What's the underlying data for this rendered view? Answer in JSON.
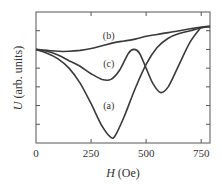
{
  "chart_data": {
    "type": "line",
    "title": "",
    "xlabel": "H (Oe)",
    "xlabel_italic": "H",
    "xlabel_unit": "(Oe)",
    "ylabel": "U (arb. units)",
    "ylabel_italic": "U",
    "ylabel_unit": "(arb. units)",
    "xlim": [
      0,
      790
    ],
    "ylim": [
      0,
      7
    ],
    "xticks": [
      0,
      250,
      500,
      750
    ],
    "xtick_labels": [
      "0",
      "250",
      "500",
      "750"
    ],
    "yticks": [
      1,
      2,
      3,
      4,
      5,
      6
    ],
    "ytick_labels": [],
    "grid": false,
    "legend": "inline curve labels",
    "series": [
      {
        "name": "(a)",
        "label_pos": [
          330,
          2.0
        ],
        "x": [
          0,
          50,
          100,
          150,
          200,
          250,
          300,
          340,
          360,
          400,
          450,
          500,
          550,
          600,
          650,
          700,
          750,
          790
        ],
        "y": [
          5.0,
          4.8,
          4.5,
          4.0,
          3.2,
          2.1,
          0.9,
          0.3,
          0.4,
          1.4,
          2.9,
          4.2,
          5.1,
          5.6,
          5.85,
          6.0,
          6.15,
          6.2
        ]
      },
      {
        "name": "(b)",
        "label_pos": [
          330,
          5.7
        ],
        "x": [
          0,
          50,
          100,
          150,
          200,
          250,
          300,
          350,
          400,
          450,
          500,
          550,
          600,
          650,
          700,
          750,
          790
        ],
        "y": [
          5.0,
          4.95,
          4.9,
          4.9,
          4.95,
          5.05,
          5.2,
          5.35,
          5.45,
          5.55,
          5.7,
          5.8,
          5.9,
          6.0,
          6.1,
          6.2,
          6.25
        ]
      },
      {
        "name": "(c)",
        "label_pos": [
          330,
          4.2
        ],
        "x": [
          0,
          50,
          100,
          150,
          200,
          250,
          300,
          340,
          380,
          420,
          445,
          470,
          500,
          530,
          565,
          600,
          650,
          700,
          750
        ],
        "y": [
          5.0,
          4.9,
          4.7,
          4.4,
          4.1,
          3.7,
          3.4,
          3.4,
          3.9,
          4.8,
          5.0,
          4.8,
          4.0,
          3.2,
          2.7,
          3.0,
          4.2,
          5.4,
          6.2
        ]
      }
    ]
  }
}
